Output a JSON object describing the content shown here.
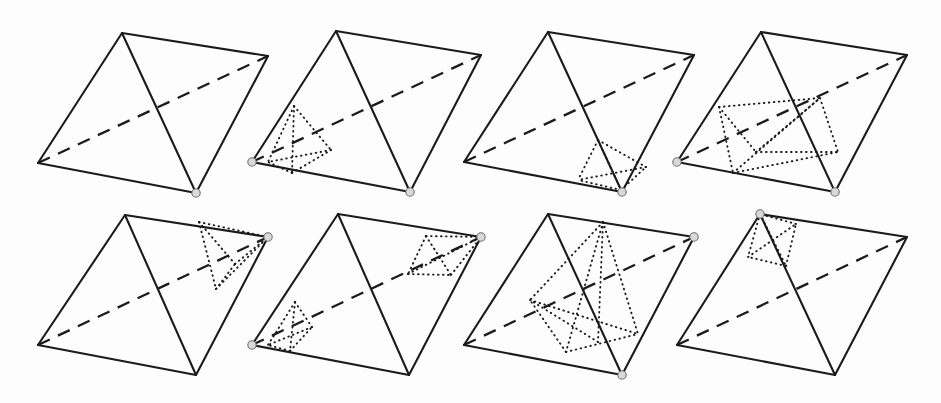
{
  "figure": {
    "background_color": "#fdfdfd",
    "stroke_color": "#1b1b1b",
    "marker_fill_color": "#d9d9d9",
    "marker_stroke_color": "#6e6e6e",
    "rows": 2,
    "columns": 4,
    "panel_count": 8,
    "line_styles": [
      "solid",
      "dashed",
      "dotted"
    ],
    "canvas": {
      "width": 941,
      "height": 403
    }
  },
  "panels": [
    {
      "id": "panel-1",
      "label": "",
      "row": 1,
      "column": 1,
      "origin": {
        "x": 0,
        "y": 0
      },
      "outer": {
        "apex": {
          "x": 122,
          "y": 33
        },
        "left": {
          "x": 38,
          "y": 163
        },
        "bottom": {
          "x": 196,
          "y": 193
        },
        "right": {
          "x": 268,
          "y": 56
        }
      },
      "solid_edges": [
        [
          122,
          33,
          38,
          163
        ],
        [
          122,
          33,
          196,
          193
        ],
        [
          122,
          33,
          268,
          56
        ],
        [
          38,
          163,
          196,
          193
        ],
        [
          196,
          193,
          268,
          56
        ]
      ],
      "dashed_edges": [
        [
          38,
          163,
          268,
          56
        ]
      ],
      "dotted_edges": [],
      "markers": [
        {
          "x": 196,
          "y": 193,
          "r": 4.2
        }
      ],
      "marker_count": 1,
      "sub_tetra_count": 0
    },
    {
      "id": "panel-2",
      "label": "",
      "row": 1,
      "column": 2,
      "origin": {
        "x": 227,
        "y": 0
      },
      "outer": {
        "apex": {
          "x": 336,
          "y": 31
        },
        "left": {
          "x": 252,
          "y": 162
        },
        "bottom": {
          "x": 410,
          "y": 192
        },
        "right": {
          "x": 481,
          "y": 55
        }
      },
      "solid_edges": [
        [
          336,
          31,
          252,
          162
        ],
        [
          336,
          31,
          410,
          192
        ],
        [
          336,
          31,
          481,
          55
        ],
        [
          252,
          162,
          410,
          192
        ],
        [
          410,
          192,
          481,
          55
        ]
      ],
      "dashed_edges": [
        [
          252,
          162,
          481,
          55
        ]
      ],
      "dotted_edges": [
        [
          294,
          106,
          292,
          173
        ],
        [
          294,
          106,
          331,
          150
        ],
        [
          294,
          106,
          268,
          162
        ],
        [
          292,
          173,
          331,
          150
        ],
        [
          292,
          173,
          268,
          162
        ],
        [
          331,
          150,
          268,
          162
        ]
      ],
      "markers": [
        {
          "x": 252,
          "y": 162,
          "r": 4.2
        },
        {
          "x": 410,
          "y": 192,
          "r": 4.2
        }
      ],
      "marker_count": 2,
      "sub_tetra_count": 1
    },
    {
      "id": "panel-3",
      "label": "",
      "row": 1,
      "column": 3,
      "origin": {
        "x": 452,
        "y": 0
      },
      "outer": {
        "apex": {
          "x": 548,
          "y": 32
        },
        "left": {
          "x": 464,
          "y": 162
        },
        "bottom": {
          "x": 622,
          "y": 192
        },
        "right": {
          "x": 694,
          "y": 55
        }
      },
      "solid_edges": [
        [
          548,
          32,
          464,
          162
        ],
        [
          548,
          32,
          622,
          192
        ],
        [
          548,
          32,
          694,
          55
        ],
        [
          464,
          162,
          622,
          192
        ],
        [
          622,
          192,
          694,
          55
        ]
      ],
      "dashed_edges": [
        [
          464,
          162,
          694,
          55
        ]
      ],
      "dotted_edges": [
        [
          598,
          140,
          621,
          190
        ],
        [
          598,
          140,
          646,
          167
        ],
        [
          598,
          140,
          578,
          180
        ],
        [
          621,
          190,
          646,
          167
        ],
        [
          621,
          190,
          578,
          180
        ],
        [
          646,
          167,
          578,
          180
        ]
      ],
      "markers": [
        {
          "x": 622,
          "y": 192,
          "r": 4.2
        }
      ],
      "marker_count": 1,
      "sub_tetra_count": 1
    },
    {
      "id": "panel-4",
      "label": "",
      "row": 1,
      "column": 4,
      "origin": {
        "x": 680,
        "y": 0
      },
      "outer": {
        "apex": {
          "x": 761,
          "y": 32
        },
        "left": {
          "x": 677,
          "y": 162
        },
        "bottom": {
          "x": 835,
          "y": 192
        },
        "right": {
          "x": 907,
          "y": 55
        }
      },
      "solid_edges": [
        [
          761,
          32,
          677,
          162
        ],
        [
          761,
          32,
          835,
          192
        ],
        [
          761,
          32,
          907,
          55
        ],
        [
          677,
          162,
          835,
          192
        ],
        [
          835,
          192,
          907,
          55
        ]
      ],
      "dashed_edges": [
        [
          677,
          162,
          907,
          55
        ]
      ],
      "dotted_edges": [
        [
          719,
          107,
          733,
          173
        ],
        [
          719,
          107,
          820,
          98
        ],
        [
          719,
          107,
          756,
          152
        ],
        [
          733,
          173,
          820,
          98
        ],
        [
          733,
          173,
          838,
          152
        ],
        [
          820,
          98,
          838,
          152
        ],
        [
          756,
          152,
          838,
          152
        ],
        [
          756,
          152,
          820,
          98
        ]
      ],
      "markers": [
        {
          "x": 677,
          "y": 162,
          "r": 4.2
        },
        {
          "x": 835,
          "y": 192,
          "r": 4.2
        }
      ],
      "marker_count": 2,
      "sub_tetra_count": 2
    },
    {
      "id": "panel-5",
      "label": "",
      "row": 2,
      "column": 1,
      "origin": {
        "x": 0,
        "y": 205
      },
      "outer": {
        "apex": {
          "x": 125,
          "y": 215
        },
        "left": {
          "x": 38,
          "y": 345
        },
        "bottom": {
          "x": 196,
          "y": 375
        },
        "right": {
          "x": 268,
          "y": 237
        }
      },
      "solid_edges": [
        [
          125,
          215,
          38,
          345
        ],
        [
          125,
          215,
          196,
          375
        ],
        [
          125,
          215,
          268,
          237
        ],
        [
          38,
          345,
          196,
          375
        ],
        [
          196,
          375,
          268,
          237
        ]
      ],
      "dashed_edges": [
        [
          38,
          345,
          268,
          237
        ]
      ],
      "dotted_edges": [
        [
          199,
          222,
          268,
          237
        ],
        [
          199,
          222,
          216,
          289
        ],
        [
          199,
          222,
          235,
          264
        ],
        [
          216,
          289,
          268,
          237
        ],
        [
          216,
          289,
          235,
          264
        ],
        [
          235,
          264,
          268,
          237
        ]
      ],
      "markers": [
        {
          "x": 268,
          "y": 237,
          "r": 4.2
        }
      ],
      "marker_count": 1,
      "sub_tetra_count": 1
    },
    {
      "id": "panel-6",
      "label": "",
      "row": 2,
      "column": 2,
      "origin": {
        "x": 240,
        "y": 205
      },
      "outer": {
        "apex": {
          "x": 338,
          "y": 214
        },
        "left": {
          "x": 252,
          "y": 345
        },
        "bottom": {
          "x": 409,
          "y": 375
        },
        "right": {
          "x": 481,
          "y": 237
        }
      },
      "solid_edges": [
        [
          338,
          214,
          252,
          345
        ],
        [
          338,
          214,
          409,
          375
        ],
        [
          338,
          214,
          481,
          237
        ],
        [
          252,
          345,
          409,
          375
        ],
        [
          409,
          375,
          481,
          237
        ]
      ],
      "dashed_edges": [
        [
          252,
          345,
          481,
          237
        ]
      ],
      "dotted_edges": [
        [
          426,
          236,
          481,
          237
        ],
        [
          426,
          236,
          451,
          275
        ],
        [
          426,
          236,
          408,
          274
        ],
        [
          451,
          275,
          481,
          237
        ],
        [
          408,
          274,
          451,
          275
        ],
        [
          408,
          274,
          481,
          237
        ],
        [
          295,
          302,
          290,
          351
        ],
        [
          295,
          302,
          312,
          327
        ],
        [
          295,
          302,
          268,
          345
        ],
        [
          290,
          351,
          312,
          327
        ],
        [
          290,
          351,
          268,
          345
        ],
        [
          312,
          327,
          268,
          345
        ]
      ],
      "markers": [
        {
          "x": 252,
          "y": 345,
          "r": 4.2
        },
        {
          "x": 481,
          "y": 237,
          "r": 4.2
        }
      ],
      "marker_count": 2,
      "sub_tetra_count": 2
    },
    {
      "id": "panel-7",
      "label": "",
      "row": 2,
      "column": 3,
      "origin": {
        "x": 460,
        "y": 205
      },
      "outer": {
        "apex": {
          "x": 548,
          "y": 214
        },
        "left": {
          "x": 464,
          "y": 345
        },
        "bottom": {
          "x": 622,
          "y": 375
        },
        "right": {
          "x": 694,
          "y": 237
        }
      },
      "solid_edges": [
        [
          548,
          214,
          464,
          345
        ],
        [
          548,
          214,
          622,
          375
        ],
        [
          548,
          214,
          694,
          237
        ],
        [
          464,
          345,
          622,
          375
        ],
        [
          622,
          375,
          694,
          237
        ]
      ],
      "dashed_edges": [
        [
          464,
          345,
          694,
          237
        ]
      ],
      "dotted_edges": [
        [
          603,
          222,
          566,
          352
        ],
        [
          603,
          222,
          530,
          300
        ],
        [
          603,
          222,
          638,
          334
        ],
        [
          566,
          352,
          530,
          300
        ],
        [
          566,
          352,
          638,
          334
        ],
        [
          530,
          300,
          638,
          334
        ],
        [
          603,
          222,
          598,
          342
        ],
        [
          598,
          342,
          530,
          300
        ]
      ],
      "markers": [
        {
          "x": 622,
          "y": 375,
          "r": 4.2
        },
        {
          "x": 694,
          "y": 237,
          "r": 4.2
        }
      ],
      "marker_count": 2,
      "sub_tetra_count": 1
    },
    {
      "id": "panel-8",
      "label": "",
      "row": 2,
      "column": 4,
      "origin": {
        "x": 680,
        "y": 205
      },
      "outer": {
        "apex": {
          "x": 760,
          "y": 214
        },
        "left": {
          "x": 677,
          "y": 345
        },
        "bottom": {
          "x": 835,
          "y": 375
        },
        "right": {
          "x": 907,
          "y": 237
        }
      },
      "solid_edges": [
        [
          760,
          214,
          677,
          345
        ],
        [
          760,
          214,
          835,
          375
        ],
        [
          760,
          214,
          907,
          237
        ],
        [
          677,
          345,
          835,
          375
        ],
        [
          835,
          375,
          907,
          237
        ]
      ],
      "dashed_edges": [
        [
          677,
          345,
          907,
          237
        ]
      ],
      "dotted_edges": [
        [
          760,
          214,
          786,
          266
        ],
        [
          760,
          214,
          748,
          257
        ],
        [
          786,
          266,
          748,
          257
        ],
        [
          786,
          266,
          796,
          224
        ],
        [
          748,
          257,
          796,
          224
        ],
        [
          796,
          224,
          760,
          214
        ]
      ],
      "markers": [
        {
          "x": 760,
          "y": 214,
          "r": 4.2
        }
      ],
      "marker_count": 1,
      "sub_tetra_count": 1
    }
  ]
}
